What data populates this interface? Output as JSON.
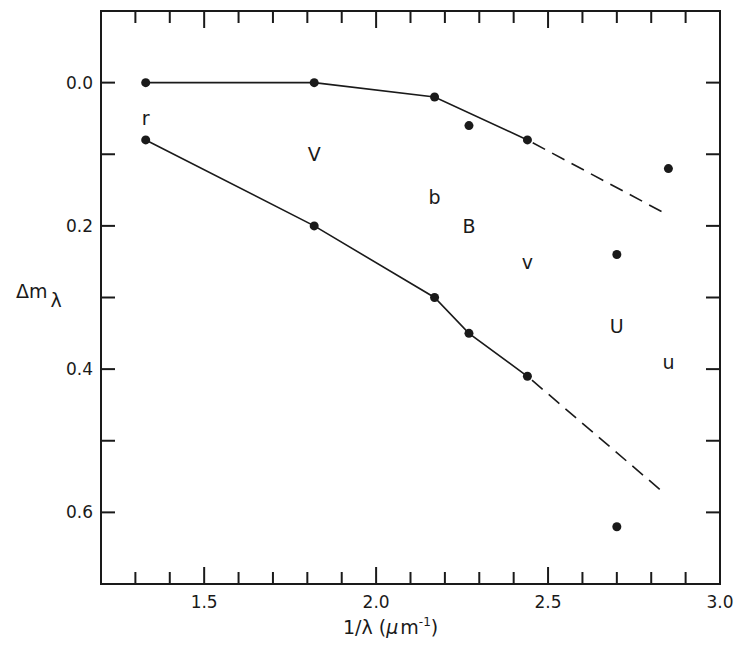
{
  "chart_data": {
    "type": "line",
    "title": "",
    "xlabel": "1/λ (μm⁻¹)",
    "ylabel": "Δmλ",
    "xlim": [
      1.2,
      3.0
    ],
    "ylim": [
      0.7,
      -0.1
    ],
    "y_inverted": true,
    "grid": false,
    "legend": null,
    "x_ticks": [
      1.5,
      2.0,
      2.5,
      3.0
    ],
    "x_tick_labels": [
      "1.5",
      "2.0",
      "2.5",
      "3.0"
    ],
    "x_minor_step": 0.1,
    "y_ticks": [
      0.0,
      0.2,
      0.4,
      0.6
    ],
    "y_tick_labels": [
      "0.0",
      "0.2",
      "0.4",
      "0.6"
    ],
    "y_minor_step": 0.1,
    "series": [
      {
        "name": "upper",
        "style": "solid-line-with-points",
        "x": [
          1.33,
          1.82,
          2.17,
          2.44
        ],
        "y": [
          0.0,
          0.0,
          0.02,
          0.08
        ],
        "extrapolation": {
          "style": "dashed",
          "from": [
            2.44,
            0.08
          ],
          "to": [
            2.83,
            0.18
          ]
        }
      },
      {
        "name": "lower",
        "style": "solid-line-with-points",
        "x": [
          1.33,
          1.82,
          2.17,
          2.27,
          2.44
        ],
        "y": [
          0.08,
          0.2,
          0.3,
          0.35,
          0.41
        ],
        "extrapolation": {
          "style": "dashed",
          "from": [
            2.44,
            0.41
          ],
          "to": [
            2.83,
            0.57
          ]
        }
      },
      {
        "name": "isolated points",
        "style": "points",
        "x": [
          2.27,
          2.7,
          2.85,
          2.7
        ],
        "y": [
          0.06,
          0.24,
          0.12,
          0.62
        ]
      }
    ],
    "annotations": [
      {
        "text": "r",
        "x": 1.33,
        "y": 0.05
      },
      {
        "text": "V",
        "x": 1.82,
        "y": 0.1
      },
      {
        "text": "b",
        "x": 2.17,
        "y": 0.16
      },
      {
        "text": "B",
        "x": 2.27,
        "y": 0.2
      },
      {
        "text": "v",
        "x": 2.44,
        "y": 0.25
      },
      {
        "text": "U",
        "x": 2.7,
        "y": 0.34
      },
      {
        "text": "u",
        "x": 2.85,
        "y": 0.39
      }
    ]
  },
  "axes": {
    "x_title_main": "1/λ (",
    "x_title_mu": "μ",
    "x_title_m": "m",
    "x_title_exp": "-1",
    "x_title_close": ")",
    "y_title_main": "Δm",
    "y_title_sub": "λ"
  },
  "colors": {
    "ink": "#1a1a1a",
    "background": "#ffffff"
  }
}
